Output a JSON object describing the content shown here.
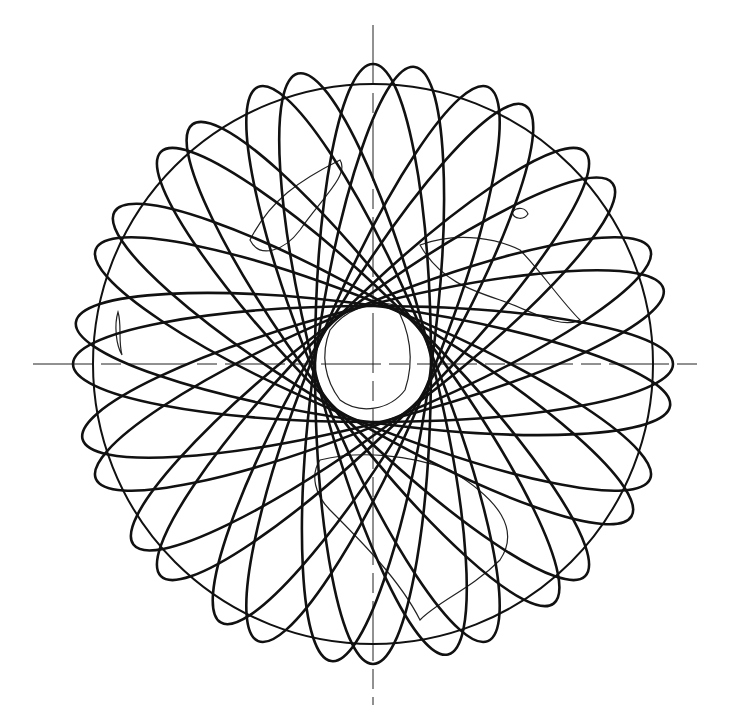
{
  "diagram": {
    "type": "orbital-ground-track-rosette",
    "title": "",
    "colors": {
      "ink": "#111111",
      "background": "#ffffff"
    },
    "globe": {
      "cx": 373,
      "cy": 364,
      "r": 280
    },
    "axes": {
      "horizontal": {
        "x1": 33,
        "x2": 697,
        "y": 364
      },
      "vertical": {
        "x": 373,
        "y1": 25,
        "y2": 705
      }
    },
    "orbits": {
      "count": 16,
      "semi_major": 300,
      "semi_minor": 58,
      "angles_deg": [
        0,
        22.5,
        45,
        67.5,
        90,
        112.5,
        135,
        157.5,
        8,
        30.5,
        53,
        75.5,
        98,
        120.5,
        143,
        165.5
      ]
    },
    "inner_clear_zone_radius": 56
  }
}
